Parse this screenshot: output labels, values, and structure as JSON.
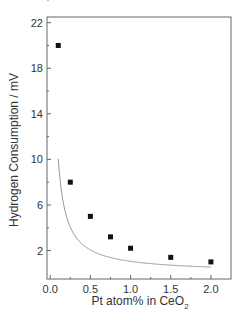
{
  "chart_data": {
    "type": "scatter",
    "title": "",
    "xlabel": "Pt atom% in CeO2",
    "xlabel_main": "Pt atom% in CeO",
    "xlabel_sub": "2",
    "ylabel": "Hydrogen Consumption / mV",
    "xlim": [
      -0.04,
      2.25
    ],
    "ylim": [
      -0.5,
      22.5
    ],
    "x_ticks": [
      "0.0",
      "0.5",
      "1.0",
      "1.5",
      "2.0"
    ],
    "y_ticks": [
      "2",
      "6",
      "10",
      "14",
      "18",
      "22"
    ],
    "grid": false,
    "legend": "none",
    "series": [
      {
        "name": "measured",
        "x": [
          0.1,
          0.25,
          0.5,
          0.75,
          1.0,
          1.5,
          2.0
        ],
        "y": [
          20.0,
          8.0,
          5.0,
          3.2,
          2.2,
          1.4,
          1.0
        ]
      }
    ],
    "fit_curve": "decaying fit line through points"
  }
}
